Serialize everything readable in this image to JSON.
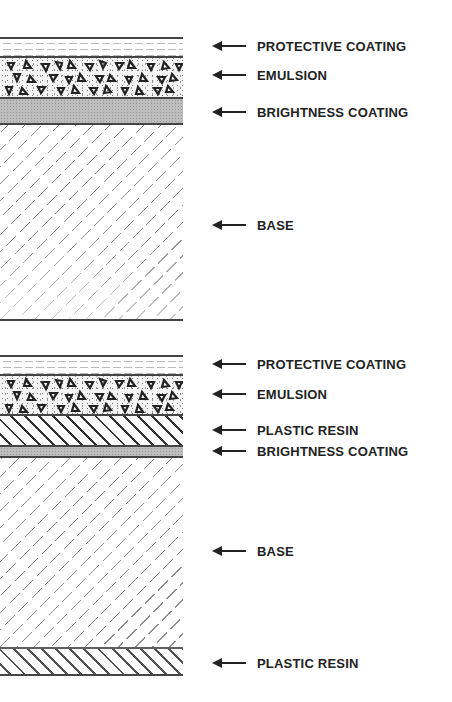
{
  "diagrams": [
    {
      "id": "top",
      "layers": [
        {
          "name": "protective-coating",
          "label": "PROTECTIVE COATING"
        },
        {
          "name": "emulsion",
          "label": "EMULSION"
        },
        {
          "name": "brightness-coating",
          "label": "BRIGHTNESS COATING"
        },
        {
          "name": "base",
          "label": "BASE"
        }
      ]
    },
    {
      "id": "bottom",
      "layers": [
        {
          "name": "protective-coating",
          "label": "PROTECTIVE COATING"
        },
        {
          "name": "emulsion",
          "label": "EMULSION"
        },
        {
          "name": "plastic-resin-top",
          "label": "PLASTIC RESIN"
        },
        {
          "name": "brightness-coating",
          "label": "BRIGHTNESS COATING"
        },
        {
          "name": "base",
          "label": "BASE"
        },
        {
          "name": "plastic-resin-bottom",
          "label": "PLASTIC RESIN"
        }
      ]
    }
  ],
  "colors": {
    "ink": "#222222",
    "rule": "#444444",
    "brightness_fill": "#bdbdbd",
    "background": "#ffffff"
  }
}
